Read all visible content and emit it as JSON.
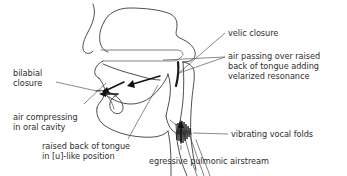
{
  "figure": {
    "ink_color": "#2e2e2e",
    "outline_color": "#3a3a3a",
    "arrow_color": "#111111",
    "background": "#ffffff"
  },
  "labels": {
    "velic_closure": "velic closure",
    "air_passing_l1": "air passing over raised",
    "air_passing_l2": "back of tongue adding",
    "air_passing_l3": "velarized resonance",
    "bilabial_l1": "bilabial",
    "bilabial_l2": "closure",
    "air_compressing_l1": "air compressing",
    "air_compressing_l2": "in oral cavity",
    "raised_back_l1": "raised back of tongue",
    "raised_back_l2": "in [u]-like position",
    "vibrating_folds": "vibrating vocal folds",
    "egressive": "egressive pulmonic airstream"
  },
  "parts": {
    "head_outline": "head-outline",
    "nasal_cavity": "nasal-cavity",
    "hard_palate": "hard-palate",
    "velum": "velum",
    "tongue": "tongue",
    "lips": "lips",
    "jaw": "jaw",
    "pharynx": "pharyngeal-wall",
    "larynx": "larynx",
    "vocal_folds": "vocal-folds"
  }
}
